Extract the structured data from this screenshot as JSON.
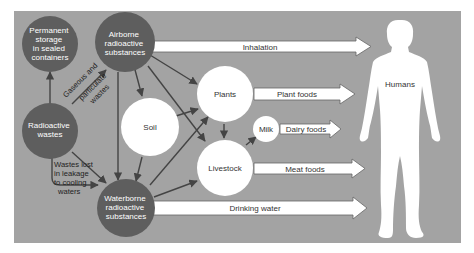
{
  "colors": {
    "panel": "#a3a3a3",
    "dark_node": "#5e5e5e",
    "light_node": "#ffffff",
    "edge": "#444444"
  },
  "nodes": {
    "permanent_storage": {
      "lines": [
        "Permanent",
        "storage",
        "in sealed",
        "containers"
      ]
    },
    "airborne": {
      "lines": [
        "Airborne",
        "radioactive",
        "substances"
      ]
    },
    "radioactive_wastes": {
      "lines": [
        "Radioactive",
        "wastes"
      ]
    },
    "waterborne": {
      "lines": [
        "Waterborne",
        "radioactive",
        "substances"
      ]
    },
    "soil": {
      "label": "Soil"
    },
    "plants": {
      "label": "Plants"
    },
    "livestock": {
      "label": "Livestock"
    },
    "milk": {
      "label": "Milk"
    },
    "humans": {
      "label": "Humans"
    }
  },
  "edge_labels": {
    "gaseous": [
      "Gaseous and",
      "particulate",
      "wastes"
    ],
    "leakage": [
      "Wastes lost",
      "in leakage",
      "to cooling",
      "waters"
    ]
  },
  "pathways": {
    "inhalation": "Inhalation",
    "plant_foods": "Plant foods",
    "dairy_foods": "Dairy foods",
    "meat_foods": "Meat foods",
    "drinking_water": "Drinking water"
  }
}
